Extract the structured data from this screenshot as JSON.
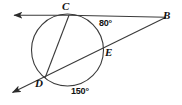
{
  "figure": {
    "type": "euclidean-geometry-figure",
    "stroke_color": "#3a3a3a",
    "label_color": "#111111",
    "background_color": "#ffffff",
    "points": {
      "C": {
        "label": "C",
        "x": 69,
        "y": 15,
        "on_circle": true
      },
      "B": {
        "label": "B",
        "x": 166,
        "y": 17,
        "on_circle": false
      },
      "E": {
        "label": "E",
        "x": 101,
        "y": 54,
        "on_circle": true
      },
      "D": {
        "label": "D",
        "x": 45,
        "y": 78,
        "on_circle": true
      }
    },
    "circle": {
      "cx": 67.5,
      "cy": 50,
      "r": 36
    },
    "lines": [
      {
        "name": "line-CB",
        "from": "arrow-left-top",
        "through": "C",
        "to": "B"
      },
      {
        "name": "secant-BD",
        "from": "B",
        "through": "E",
        "to": "D",
        "extends_to": "arrow-lower-left"
      },
      {
        "name": "chord-CD",
        "from": "C",
        "to": "D"
      }
    ],
    "arcs": [
      {
        "name": "arc-CE",
        "measure": "80°",
        "label": "80°"
      },
      {
        "name": "arc-D-to-E-lower",
        "measure": "150°",
        "label": "150°"
      }
    ],
    "arrows": [
      {
        "name": "arrow-left-top",
        "x": 12,
        "y": 15,
        "direction": "left"
      },
      {
        "name": "arrow-lower-left",
        "x": 11,
        "y": 93,
        "direction": "lower-left"
      }
    ]
  }
}
